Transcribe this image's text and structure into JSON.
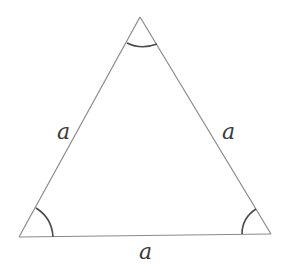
{
  "diagram": {
    "vertices": [
      "apex",
      "bottom-left",
      "bottom-right"
    ],
    "sides": [
      {
        "name": "left",
        "label": "a"
      },
      {
        "name": "right",
        "label": "a"
      },
      {
        "name": "base",
        "label": "a"
      }
    ],
    "angle_marks": [
      "apex",
      "bottom-left",
      "bottom-right"
    ]
  }
}
